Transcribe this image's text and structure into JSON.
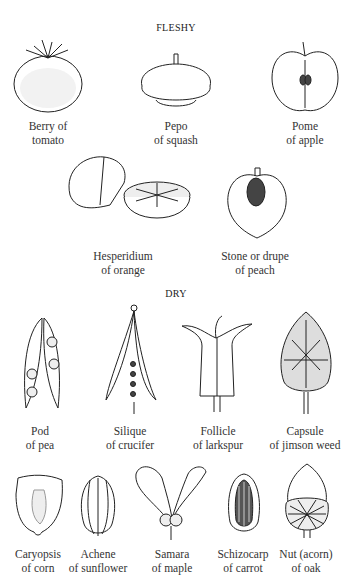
{
  "sections": {
    "fleshy": {
      "heading": "FLESHY",
      "items": [
        {
          "line1": "Berry of",
          "line2": "tomato",
          "icon": "tomato-illustration"
        },
        {
          "line1": "Pepo",
          "line2": "of squash",
          "icon": "squash-illustration"
        },
        {
          "line1": "Pome",
          "line2": "of apple",
          "icon": "apple-illustration"
        },
        {
          "line1": "Hesperidium",
          "line2": "of orange",
          "icon": "orange-illustration"
        },
        {
          "line1": "Stone or drupe",
          "line2": "of peach",
          "icon": "peach-illustration"
        }
      ]
    },
    "dry": {
      "heading": "DRY",
      "items": [
        {
          "line1": "Pod",
          "line2": "of pea",
          "icon": "pea-pod-illustration"
        },
        {
          "line1": "Silique",
          "line2": "of crucifer",
          "icon": "silique-illustration"
        },
        {
          "line1": "Follicle",
          "line2": "of larkspur",
          "icon": "larkspur-follicle-illustration"
        },
        {
          "line1": "Capsule",
          "line2": "of jimson weed",
          "icon": "jimson-capsule-illustration"
        },
        {
          "line1": "Caryopsis",
          "line2": "of corn",
          "icon": "corn-kernel-illustration"
        },
        {
          "line1": "Achene",
          "line2": "of sunflower",
          "icon": "sunflower-achene-illustration"
        },
        {
          "line1": "Samara",
          "line2": "of maple",
          "icon": "maple-samara-illustration"
        },
        {
          "line1": "Schizocarp",
          "line2": "of carrot",
          "icon": "carrot-schizocarp-illustration"
        },
        {
          "line1": "Nut (acorn)",
          "line2": "of oak",
          "icon": "acorn-illustration"
        }
      ]
    }
  }
}
